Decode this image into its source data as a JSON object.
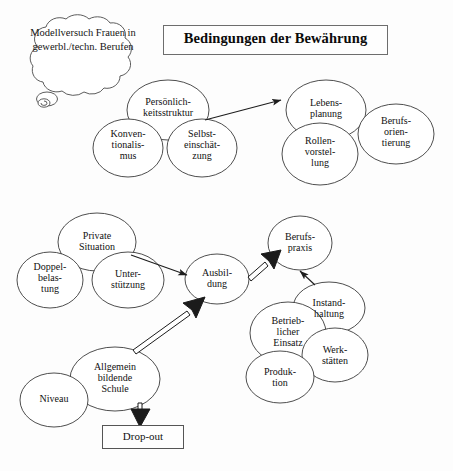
{
  "figure": {
    "title": "Bedingungen der Bewährung",
    "thought_bubble": "Modellversuch\nFrauen in\ngewerbl./techn.\nBerufen",
    "dropout_box": "Drop-out"
  },
  "nodes": {
    "persoenlichkeitsstruktur": "Persönlich-\nkeitsstruktur",
    "konventionalismus": "Konven-\ntionalis-\nmus",
    "selbsteinschaetzung": "Selbst-\neinschät-\nzung",
    "lebensplanung": "Lebens-\nplanung",
    "berufsorientierung": "Berufs-\norien-\ntierung",
    "rollenvorstellung": "Rollen-\nvorstel-\nlung",
    "private_situation": "Private\nSituation",
    "doppelbelastung": "Doppel-\nbelas-\ntung",
    "unterstuetzung": "Unter-\nstützung",
    "ausbildung": "Ausbil-\ndung",
    "berufspraxis": "Berufs-\npraxis",
    "instandhaltung": "Instand-\nhaltung",
    "betrieblicher_einsatz": "Betrieb-\nlicher\nEinsatz",
    "werkstaetten": "Werk-\nstätten",
    "produktion": "Produk-\ntion",
    "allgemeinbildende_schule": "Allgemein\nbildende\nSchule",
    "niveau": "Niveau"
  },
  "colors": {
    "stroke": "#3a3a3a",
    "title_border": "#6d6d6d",
    "text": "#111111",
    "background": "#fdfdfd"
  },
  "edges": [
    {
      "from": "persoenlichkeitsstruktur",
      "to": "lebensplanung",
      "style": "thin-arrow"
    },
    {
      "from": "private_situation",
      "to": "ausbildung",
      "style": "thin-arrow"
    },
    {
      "from": "allgemeinbildende_schule",
      "to": "ausbildung",
      "style": "double-arrow"
    },
    {
      "from": "ausbildung",
      "to": "berufspraxis",
      "style": "double-arrow"
    },
    {
      "from": "instandhaltung",
      "to": "berufspraxis",
      "style": "thin-arrow"
    },
    {
      "from": "allgemeinbildende_schule",
      "to": "dropout_box",
      "style": "double-arrow"
    }
  ]
}
